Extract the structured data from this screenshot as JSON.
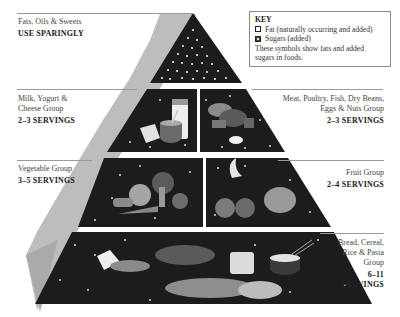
{
  "key": {
    "title": "KEY",
    "items": [
      {
        "symbol": "fat-symbol",
        "label": "Fat (naturally occurring and added)"
      },
      {
        "symbol": "sugar-symbol",
        "label": "Sugars (added)"
      }
    ],
    "note": "These symbols show fats and added sugars in foods."
  },
  "tiers": {
    "top": {
      "name": "Fats, Oils & Sweets",
      "servings": "USE SPARINGLY"
    },
    "dairy": {
      "name_line1": "Milk, Yogurt &",
      "name_line2": "Cheese Group",
      "servings": "2–3 SERVINGS"
    },
    "meat": {
      "name_line1": "Meat, Poultry, Fish, Dry Beans,",
      "name_line2": "Eggs & Nuts Group",
      "servings": "2–3 SERVINGS"
    },
    "vegetable": {
      "name": "Vegetable Group",
      "servings": "3–5 SERVINGS"
    },
    "fruit": {
      "name": "Fruit Group",
      "servings": "2–4 SERVINGS"
    },
    "grain": {
      "name_line1": "Bread, Cereal,",
      "name_line2": "Rice & Pasta",
      "name_line3": "Group",
      "servings_line1": "6–11",
      "servings_line2": "SERVINGS"
    }
  },
  "colors": {
    "tier_fill": "#1c1c1c",
    "side_shade": "#b8b8b8",
    "dot": "#e8e8e8",
    "rule": "#9a9a9a"
  }
}
